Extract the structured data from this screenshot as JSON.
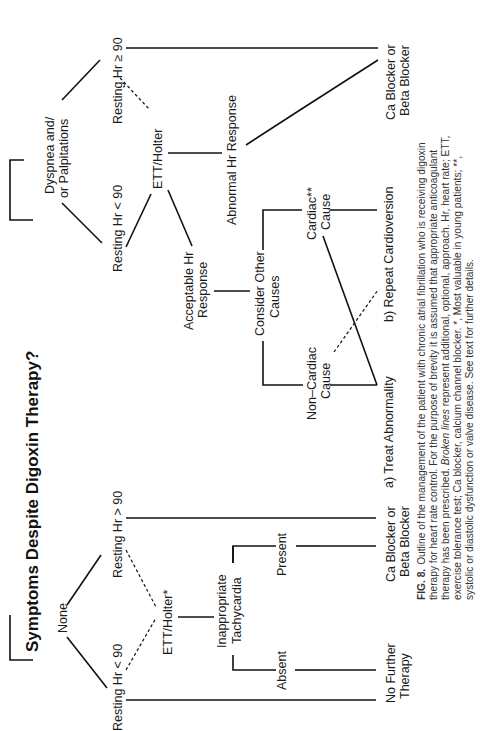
{
  "title": "Symptoms Despite Digoxin Therapy?",
  "nodes": {
    "none": "None",
    "dyspnea_l1": "Dyspnea  and/",
    "dyspnea_l2": "or  Palpitations",
    "resting_lt90_left": "Resting  Hr  < 90",
    "resting_gt90_left": "Resting  Hr  > 90",
    "ett_holter_star": "ETT/Holter*",
    "inappropriate_l1": "Inappropriate",
    "inappropriate_l2": "Tachycardia",
    "absent": "Absent",
    "present": "Present",
    "no_further_l1": "No  Further",
    "no_further_l2": "Therapy",
    "ca_beta_left_l1": "Ca  Blocker  or",
    "ca_beta_left_l2": "Beta  Blocker",
    "resting_lt90_right": "Resting  Hr  < 90",
    "resting_ge90_right": "Resting  Hr  ≥ 90",
    "ett_holter": "ETT/Holter",
    "acceptable_l1": "Acceptable  Hr",
    "acceptable_l2": "Response",
    "abnormal": "Abnormal  Hr  Response",
    "consider_l1": "Consider  Other",
    "consider_l2": "Causes",
    "non_cardiac_l1": "Non–Cardiac",
    "non_cardiac_l2": "Cause",
    "cardiac_l1": "Cardiac**",
    "cardiac_l2": "Cause",
    "treat": "a)  Treat  Abnormality",
    "repeat": "b)  Repeat  Cardioversion",
    "ca_beta_right_l1": "Ca  Blocker  or",
    "ca_beta_right_l2": "Beta  Blocker"
  },
  "caption": {
    "label": "FIG. 8.",
    "line1": "Outline of the management of the patient with chronic atrial fibrillation who is receiving digoxin",
    "line2": "therapy for heart rate control. For the purpose of brevity it is assumed that appropriate anticoagulant",
    "line3_pre": "therapy has been prescribed. ",
    "line3_italic": "Broken lines",
    "line3_post": " represent additional, optional, approach. Hr, heart rate; ETT,",
    "line4": "exercise tolerance test; Ca blocker, calcium channel blocker. *, Most valuable in young patients; **,",
    "line5": "systolic or diastolic dysfunction or valve disease. See text for further details."
  }
}
